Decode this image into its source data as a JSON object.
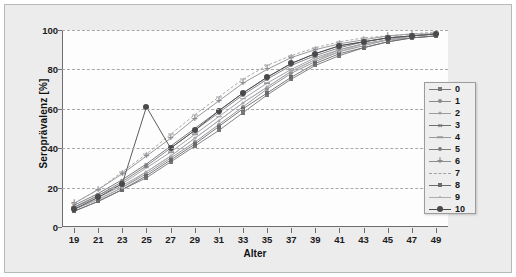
{
  "chart_data": {
    "type": "line",
    "title": "",
    "xlabel": "Alter",
    "ylabel": "Seroprävalenz [%]",
    "xlim": [
      18,
      50
    ],
    "ylim": [
      0,
      100
    ],
    "grid": true,
    "grid_style": "dashed horizontal",
    "legend_position": "right",
    "x_ticks": [
      19,
      21,
      23,
      25,
      27,
      29,
      31,
      33,
      35,
      37,
      39,
      41,
      43,
      45,
      47,
      49
    ],
    "y_ticks": [
      0,
      20,
      40,
      60,
      80,
      100
    ],
    "x": [
      19,
      21,
      23,
      25,
      27,
      29,
      31,
      33,
      35,
      37,
      39,
      41,
      43,
      45,
      47,
      49
    ],
    "series": [
      {
        "name": "0",
        "marker": "square",
        "color": "#77777a",
        "values": [
          8,
          13,
          19,
          25,
          33,
          41,
          49,
          58,
          67,
          75,
          82,
          87,
          91,
          94,
          96,
          97
        ]
      },
      {
        "name": "1",
        "marker": "circle",
        "color": "#8a8a8d",
        "values": [
          9,
          14,
          20,
          27,
          35,
          43,
          52,
          61,
          70,
          78,
          84,
          89,
          92,
          95,
          96,
          97
        ]
      },
      {
        "name": "2",
        "marker": "dot-small",
        "color": "#9b9b9e",
        "values": [
          10,
          15,
          21,
          28,
          36,
          45,
          54,
          63,
          71,
          79,
          85,
          90,
          93,
          95,
          97,
          98
        ]
      },
      {
        "name": "3",
        "marker": "x",
        "color": "#6e6e71",
        "values": [
          11,
          17,
          24,
          32,
          41,
          50,
          59,
          68,
          76,
          83,
          88,
          92,
          94,
          96,
          97,
          98
        ]
      },
      {
        "name": "4",
        "marker": "dash",
        "color": "#9a9a9d",
        "values": [
          10,
          16,
          22,
          30,
          38,
          47,
          56,
          65,
          73,
          80,
          86,
          90,
          93,
          95,
          97,
          98
        ]
      },
      {
        "name": "5",
        "marker": "circle-filled",
        "color": "#7c7c80",
        "values": [
          10,
          16,
          23,
          31,
          40,
          49,
          58,
          67,
          75,
          82,
          87,
          91,
          94,
          96,
          97,
          98
        ]
      },
      {
        "name": "6",
        "marker": "plus",
        "color": "#8d8d90",
        "values": [
          12,
          19,
          27,
          36,
          45,
          55,
          64,
          73,
          80,
          86,
          90,
          93,
          95,
          97,
          98,
          98
        ]
      },
      {
        "name": "7",
        "marker": "dashed-line",
        "color": "#a0a0a3",
        "values": [
          12,
          19,
          28,
          37,
          47,
          57,
          66,
          75,
          82,
          87,
          91,
          94,
          96,
          97,
          98,
          99
        ]
      },
      {
        "name": "8",
        "marker": "square-filled",
        "color": "#6a6a6d",
        "values": [
          8,
          13,
          19,
          26,
          34,
          42,
          51,
          60,
          68,
          76,
          83,
          88,
          91,
          94,
          96,
          97
        ]
      },
      {
        "name": "9",
        "marker": "dot-tiny",
        "color": "#adadb0",
        "values": [
          9,
          14,
          20,
          28,
          36,
          45,
          54,
          63,
          71,
          79,
          85,
          89,
          93,
          95,
          97,
          98
        ]
      },
      {
        "name": "10",
        "marker": "circle-dark",
        "color": "#4a4a4d",
        "values": [
          9,
          15,
          22,
          61,
          40,
          49,
          59,
          68,
          76,
          83,
          88,
          92,
          94,
          96,
          97,
          98
        ]
      }
    ],
    "outliers": [
      {
        "series": "10",
        "x": 25,
        "y": 61
      },
      {
        "series": "6",
        "x": 25,
        "y": 44
      },
      {
        "series": "7",
        "x": 31,
        "y": 73
      }
    ]
  },
  "legend": {
    "entries": [
      "0",
      "1",
      "2",
      "3",
      "4",
      "5",
      "6",
      "7",
      "8",
      "9",
      "10"
    ]
  },
  "axes": {
    "x_title": "Alter",
    "y_title": "Seroprävalenz [%]"
  }
}
